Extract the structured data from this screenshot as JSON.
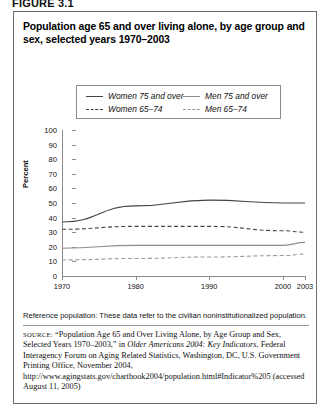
{
  "figure_label": "FIGURE 3.1",
  "title": "Population age 65 and over living alone, by age group and sex, selected years 1970–2003",
  "legend": {
    "women_75_over": "Women 75 and over",
    "men_75_over": "Men 75 and over",
    "women_65_74": "Women 65–74",
    "men_65_74": "Men 65–74"
  },
  "reference_note": "Reference population: These data refer to the civilian noninstitutionalized population.",
  "source": {
    "label": "SOURCE:",
    "text_1": "“Population Age 65 and Over Living Alone, by Age Group and Sex, Selected Years 1970–2003,” in ",
    "italic_title": "Older Americans 2004: Key Indicators",
    "text_2": ", Federal Interagency Forum on Aging Related Statistics, Washington, DC, U.S. Government Printing Office, November 2004, http://www.agingstats.gov/chartbook2004/population.html#Indicator%205 (accessed August 11, 2005)"
  },
  "chart_data": {
    "type": "line",
    "title": "Population age 65 and over living alone, by age group and sex, selected years 1970–2003",
    "xlabel": "",
    "ylabel": "Percent",
    "xlim": [
      1970,
      2003
    ],
    "ylim": [
      0,
      100
    ],
    "ytick_labels": [
      "0",
      "10",
      "20",
      "30",
      "40",
      "50",
      "60",
      "70",
      "80",
      "90",
      "100"
    ],
    "yticks": [
      0,
      10,
      20,
      30,
      40,
      50,
      60,
      70,
      80,
      90,
      100
    ],
    "xtick_labels": [
      "1970",
      "1980",
      "1990",
      "2000",
      "2003"
    ],
    "xticks": [
      1970,
      1980,
      1990,
      2000,
      2003
    ],
    "grid": false,
    "legend_position": "top",
    "x": [
      1970,
      1980,
      1990,
      2000,
      2003
    ],
    "series": [
      {
        "name": "Women 75 and over",
        "style": "solid",
        "color": "#444444",
        "values": [
          37,
          48,
          52,
          50,
          50
        ]
      },
      {
        "name": "Women 65–74",
        "style": "dashed",
        "color": "#444444",
        "values": [
          32,
          34,
          34,
          31,
          30
        ]
      },
      {
        "name": "Men 75 and over",
        "style": "solid",
        "color": "#8d8d8d",
        "values": [
          19,
          21,
          21,
          21,
          23
        ]
      },
      {
        "name": "Men 65–74",
        "style": "dashed",
        "color": "#9a9a9a",
        "values": [
          11,
          12,
          13,
          14,
          15
        ]
      }
    ]
  }
}
